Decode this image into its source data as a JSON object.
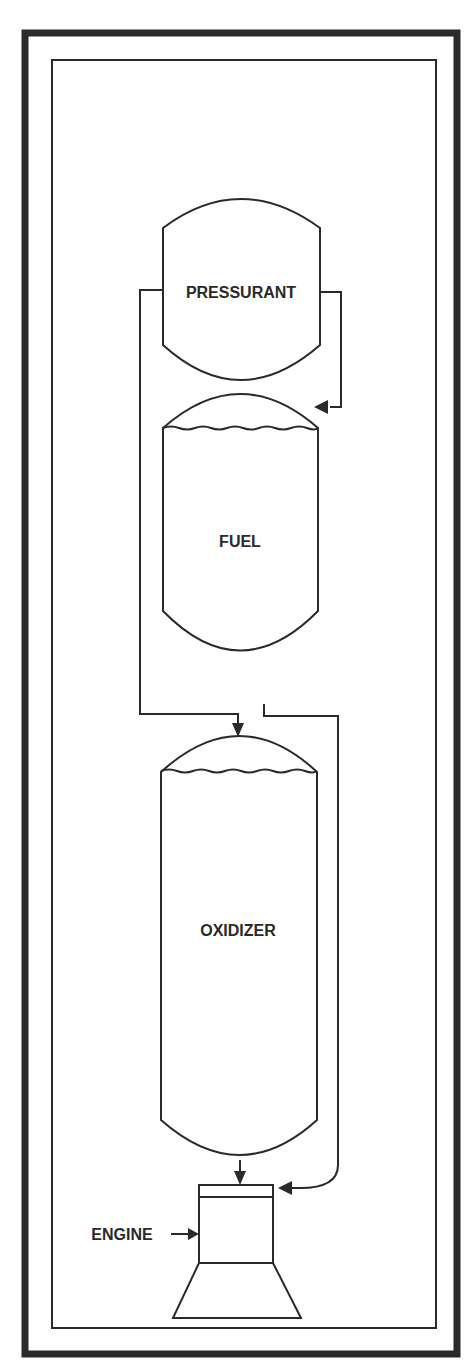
{
  "diagram": {
    "type": "pressure-fed propulsion schematic",
    "colors": {
      "line": "#2a2a2a",
      "background": "#ffffff"
    },
    "components": {
      "pressurant": {
        "label": "PRESSURANT"
      },
      "fuel": {
        "label": "FUEL"
      },
      "oxidizer": {
        "label": "OXIDIZER"
      },
      "engine": {
        "label": "ENGINE"
      }
    },
    "connections": [
      {
        "from": "pressurant",
        "to": "fuel"
      },
      {
        "from": "pressurant",
        "to": "oxidizer"
      },
      {
        "from": "fuel",
        "to": "engine"
      },
      {
        "from": "oxidizer",
        "to": "engine"
      }
    ]
  }
}
